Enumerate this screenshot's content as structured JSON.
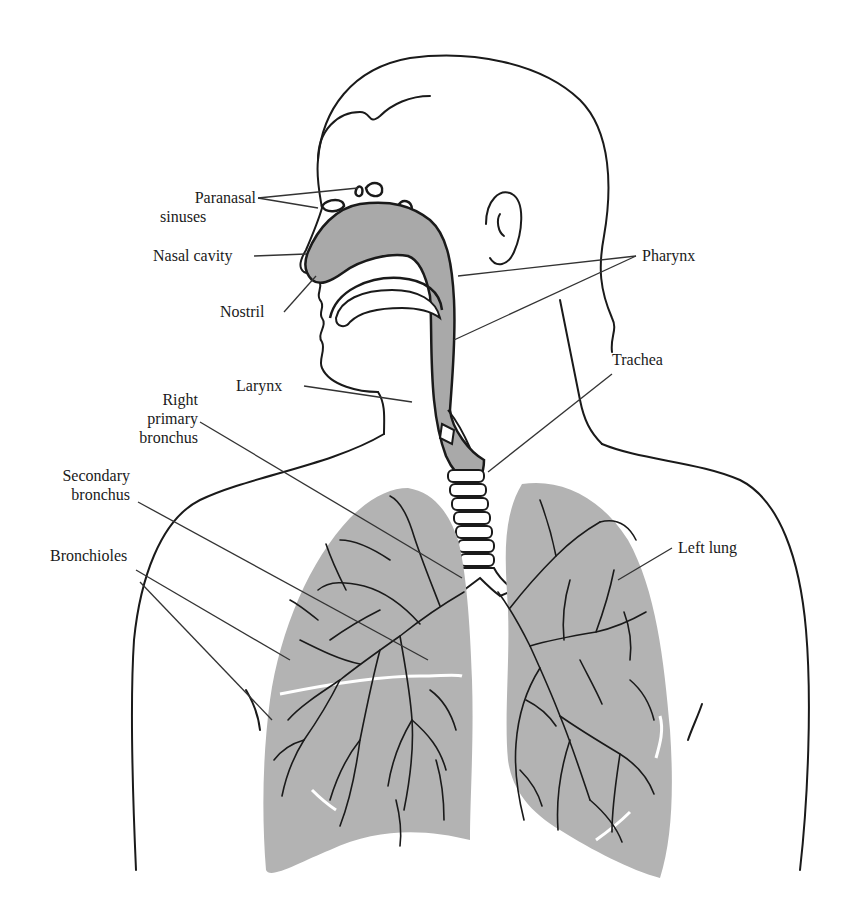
{
  "diagram": {
    "colors": {
      "outline": "#1a1a1a",
      "airway_fill": "#a9a9a9",
      "lung_fill": "#b3b3b3",
      "background": "#ffffff",
      "leader_line": "#333333"
    },
    "labels": {
      "paranasal_sinuses_1": "Paranasal",
      "paranasal_sinuses_2": "sinuses",
      "nasal_cavity": "Nasal cavity",
      "nostril": "Nostril",
      "pharynx": "Pharynx",
      "larynx": "Larynx",
      "trachea": "Trachea",
      "right_primary_bronchus_1": "Right",
      "right_primary_bronchus_2": "primary",
      "right_primary_bronchus_3": "bronchus",
      "secondary_bronchus_1": "Secondary",
      "secondary_bronchus_2": "bronchus",
      "bronchioles": "Bronchioles",
      "left_lung": "Left lung"
    }
  }
}
